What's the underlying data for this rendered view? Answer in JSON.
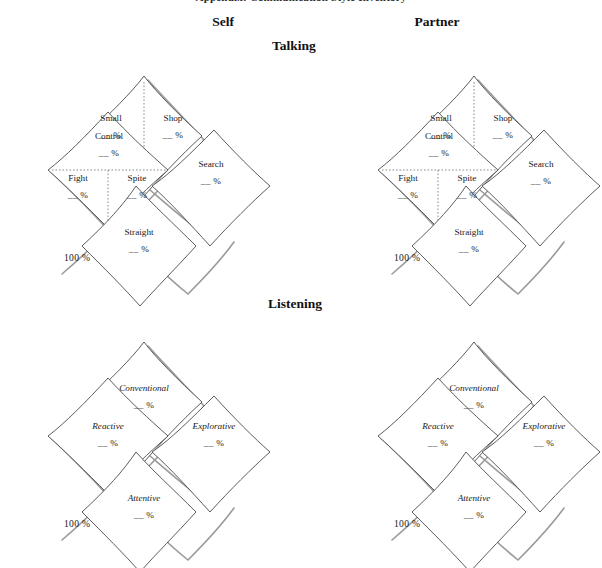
{
  "document": {
    "cut_off_header": "Appendix: Communication Style Inventory",
    "columns": [
      {
        "id": "self",
        "label": "Self"
      },
      {
        "id": "partner",
        "label": "Partner"
      }
    ],
    "rows": [
      {
        "id": "talking",
        "label": "Talking"
      },
      {
        "id": "listening",
        "label": "Listening"
      }
    ]
  },
  "blank_value": "__ %",
  "total_label": "100 %",
  "talking_petals": {
    "top": {
      "left": {
        "name": "Small",
        "value": "__ %"
      },
      "right": {
        "name": "Shop",
        "value": "__ %"
      }
    },
    "left": {
      "top": {
        "name": "Control",
        "value": "__ %"
      },
      "bottomleft": {
        "name": "Fight",
        "value": "__ %"
      },
      "bottomright": {
        "name": "Spite",
        "value": "__ %"
      }
    },
    "right": {
      "name": "Search",
      "value": "__ %"
    },
    "bottom": {
      "name": "Straight",
      "value": "__ %"
    }
  },
  "listening_petals": {
    "top": {
      "name": "Conventional",
      "value": "__ %"
    },
    "left": {
      "name": "Reactive",
      "value": "__ %"
    },
    "right": {
      "name": "Explorative",
      "value": "__ %"
    },
    "bottom": {
      "name": "Attentive",
      "value": "__ %"
    }
  },
  "colors": {
    "ink": "#1a1a1a",
    "outline": "#4a4a4a",
    "shadow": "#9a9a9a",
    "divider": "#777777",
    "background": "#ffffff"
  }
}
